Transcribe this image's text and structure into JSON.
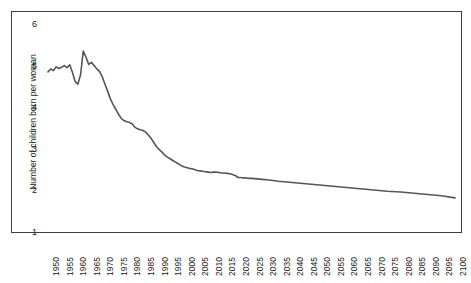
{
  "chart_data": {
    "type": "line",
    "title": "",
    "xlabel": "",
    "ylabel": "Number of children born per woman",
    "xlim": [
      1950,
      2100
    ],
    "ylim": [
      1,
      6
    ],
    "grid": false,
    "legend": null,
    "y_ticks": [
      6,
      5,
      4,
      3,
      2,
      1
    ],
    "x_ticks": [
      1950,
      1955,
      1960,
      1965,
      1970,
      1975,
      1980,
      1985,
      1990,
      1995,
      2000,
      2005,
      2010,
      2015,
      2020,
      2025,
      2030,
      2035,
      2040,
      2045,
      2050,
      2055,
      2060,
      2065,
      2070,
      2075,
      2080,
      2085,
      2090,
      2095,
      2100
    ],
    "series": [
      {
        "name": "Total fertility rate",
        "color": "#555555",
        "x": [
          1950,
          1951,
          1952,
          1953,
          1954,
          1955,
          1956,
          1957,
          1958,
          1959,
          1960,
          1961,
          1962,
          1963,
          1964,
          1965,
          1966,
          1967,
          1968,
          1969,
          1970,
          1971,
          1972,
          1973,
          1974,
          1975,
          1976,
          1977,
          1978,
          1979,
          1980,
          1981,
          1982,
          1983,
          1984,
          1985,
          1986,
          1987,
          1988,
          1989,
          1990,
          1991,
          1992,
          1993,
          1994,
          1995,
          1996,
          1997,
          1998,
          1999,
          2000,
          2001,
          2002,
          2003,
          2004,
          2005,
          2006,
          2007,
          2008,
          2009,
          2010,
          2011,
          2012,
          2013,
          2014,
          2015,
          2016,
          2017,
          2018,
          2019,
          2020,
          2021,
          2022,
          2023,
          2024,
          2025,
          2030,
          2035,
          2040,
          2045,
          2050,
          2055,
          2060,
          2065,
          2070,
          2075,
          2080,
          2085,
          2090,
          2095,
          2100
        ],
        "y": [
          4.85,
          4.92,
          4.88,
          4.97,
          4.93,
          4.96,
          5.0,
          4.95,
          5.02,
          4.84,
          4.62,
          4.55,
          4.78,
          5.35,
          5.2,
          5.03,
          5.08,
          5.0,
          4.92,
          4.86,
          4.73,
          4.55,
          4.38,
          4.2,
          4.06,
          3.95,
          3.83,
          3.73,
          3.68,
          3.65,
          3.63,
          3.6,
          3.52,
          3.48,
          3.46,
          3.44,
          3.4,
          3.33,
          3.25,
          3.15,
          3.05,
          2.98,
          2.92,
          2.85,
          2.8,
          2.76,
          2.72,
          2.68,
          2.64,
          2.6,
          2.57,
          2.55,
          2.53,
          2.52,
          2.5,
          2.48,
          2.47,
          2.46,
          2.45,
          2.44,
          2.43,
          2.44,
          2.44,
          2.43,
          2.42,
          2.42,
          2.41,
          2.4,
          2.38,
          2.36,
          2.31,
          2.31,
          2.3,
          2.3,
          2.29,
          2.29,
          2.26,
          2.22,
          2.19,
          2.16,
          2.13,
          2.1,
          2.07,
          2.04,
          2.01,
          1.98,
          1.96,
          1.93,
          1.9,
          1.87,
          1.82
        ]
      }
    ]
  }
}
